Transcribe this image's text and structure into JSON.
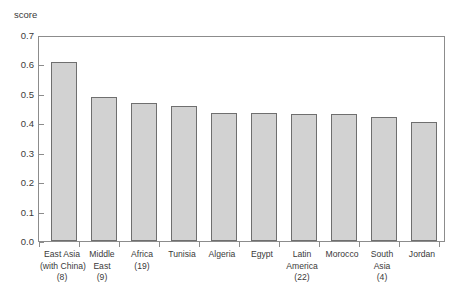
{
  "chart_data": {
    "type": "bar",
    "title": "",
    "subtitle": "",
    "xlabel": "",
    "ylabel": "score",
    "ylim": [
      0.0,
      0.7
    ],
    "yticks": [
      "0.0",
      "0.1",
      "0.2",
      "0.3",
      "0.4",
      "0.5",
      "0.6",
      "0.7"
    ],
    "ytick_values": [
      0.0,
      0.1,
      0.2,
      0.3,
      0.4,
      0.5,
      0.6,
      0.7
    ],
    "grid": false,
    "legend": "none",
    "categories": [
      "East Asia (with China) (8)",
      "Middle East (9)",
      "Africa (19)",
      "Tunisia",
      "Algeria",
      "Egypt",
      "Latin America (22)",
      "Morocco",
      "South Asia (4)",
      "Jordan"
    ],
    "category_lines": [
      [
        "East Asia",
        "(with China)",
        "(8)"
      ],
      [
        "Middle",
        "East",
        "(9)"
      ],
      [
        "Africa",
        "(19)",
        ""
      ],
      [
        "Tunisia",
        "",
        ""
      ],
      [
        "Algeria",
        "",
        ""
      ],
      [
        "Egypt",
        "",
        ""
      ],
      [
        "Latin",
        "America",
        "(22)"
      ],
      [
        "Morocco",
        "",
        ""
      ],
      [
        "South",
        "Asia",
        "(4)"
      ],
      [
        "Jordan",
        "",
        ""
      ]
    ],
    "values": [
      0.61,
      0.49,
      0.47,
      0.46,
      0.435,
      0.435,
      0.43,
      0.43,
      0.42,
      0.405
    ],
    "bar_fill_color": "#d2d2d2",
    "bar_border_color": "#6f6f6f",
    "axis_color": "#8c8c8c",
    "text_color": "#3a3a3a",
    "background_color": "#ffffff"
  }
}
